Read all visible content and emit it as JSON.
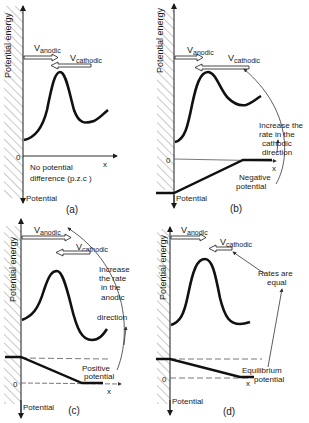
{
  "panels": [
    {
      "id": "a",
      "label": "(a)",
      "y_axis_label": "Potential energy",
      "x_axis_label": "x",
      "zero_label": "0",
      "potential_label": "Potential",
      "v_anodic": "V",
      "v_anodic_sub": "anodic",
      "v_cathodic": "V",
      "v_cathodic_sub": "cathodic",
      "note_lines": [
        "No potential",
        "difference (p.z.c )"
      ]
    },
    {
      "id": "b",
      "label": "(b)",
      "y_axis_label": "Potential energy",
      "x_axis_label": "x",
      "zero_label": "0",
      "potential_label": "Potential",
      "v_anodic": "V",
      "v_anodic_sub": "anodic",
      "v_cathodic": "V",
      "v_cathodic_sub": "cathodic",
      "note_lines": [
        "Increase the",
        "rate in the",
        "cathodic",
        "direction"
      ],
      "potential_note_lines": [
        "Negative",
        "potential"
      ]
    },
    {
      "id": "c",
      "label": "(c)",
      "y_axis_label": "Potential energy",
      "x_axis_label": "x",
      "zero_label": "0",
      "potential_label": "Potential",
      "v_anodic": "V",
      "v_anodic_sub": "anodic",
      "v_cathodic": "V",
      "v_cathodic_sub": "cathodic",
      "note_lines": [
        "Increase",
        "the rate",
        "in the",
        "anodic",
        "direction"
      ],
      "potential_note_lines": [
        "Positive",
        "potential"
      ]
    },
    {
      "id": "d",
      "label": "(d)",
      "y_axis_label": "Potential energy",
      "x_axis_label": "x",
      "zero_label": "0",
      "potential_label": "Potential",
      "v_anodic": "V",
      "v_anodic_sub": "anodic",
      "v_cathodic": "V",
      "v_cathodic_sub": "cathodic",
      "note_lines": [
        "Rates are",
        "equal"
      ],
      "potential_note_lines": [
        "Equilibrium",
        "potential"
      ]
    }
  ]
}
